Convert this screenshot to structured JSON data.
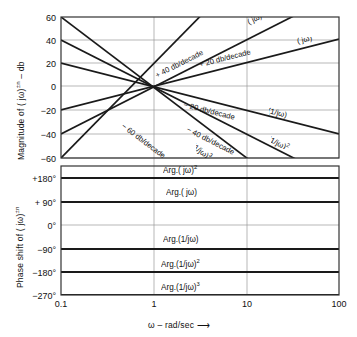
{
  "figure": {
    "x_axis": {
      "label": "ω – rad/sec ⟶",
      "ticks": [
        "0.1",
        "1",
        "10",
        "100"
      ],
      "tick_values": [
        0.1,
        1,
        10,
        100
      ],
      "scale": "log"
    },
    "magnitude_panel": {
      "axis_title_html": "Magnitude of ( jω)<sup>±n</sup> – db",
      "ticks": [
        "60",
        "40",
        "20",
        "0",
        "−20",
        "−40",
        "−60"
      ],
      "tick_values": [
        60,
        40,
        20,
        0,
        -20,
        -40,
        -60
      ]
    },
    "phase_panel": {
      "axis_title_html": "Phase shift of ( jω)<sup>±n</sup>",
      "ticks": [
        "+180°",
        "+ 90°",
        "0°",
        "−90°",
        "−180°",
        "−270°"
      ],
      "tick_values": [
        180,
        90,
        0,
        -90,
        -180,
        -270
      ]
    },
    "slope_annotations": [
      {
        "text": "+ 40 db/decade"
      },
      {
        "text": "+ 20 db/decade"
      },
      {
        "text": "− 20 db/decade"
      },
      {
        "text": "− 40 db/decade"
      },
      {
        "text": "− 60 db/decade"
      }
    ],
    "curve_labels": [
      {
        "text_html": "( jω)<sup>2</sup>"
      },
      {
        "text_html": "( jω)"
      },
      {
        "text_html": "(1/jω)"
      },
      {
        "text_html": "(1/jω)<sup>2</sup>"
      },
      {
        "text_html": "(1/jω)<sup>3</sup>"
      }
    ],
    "phase_line_labels": [
      {
        "text_html": "Arg.( jω)<sup>2</sup>"
      },
      {
        "text_html": "Arg.( jω)"
      },
      {
        "text_html": "Arg.(1/jω)"
      },
      {
        "text_html": "Arg.(1/jω)<sup>2</sup>"
      },
      {
        "text_html": "Arg.(1/jω)<sup>3</sup>"
      }
    ],
    "colors": {
      "line": "#1a1a1a",
      "grid": "#9a9a9a",
      "frame": "#333333",
      "background": "#ffffff"
    }
  },
  "chart_data": {
    "type": "line",
    "title": "",
    "xlabel": "ω – rad/sec",
    "xscale": "log",
    "xlim": [
      0.1,
      100
    ],
    "xticks": [
      0.1,
      1,
      10,
      100
    ],
    "panels": [
      {
        "name": "magnitude",
        "ylabel": "Magnitude of (jω)^±n – db",
        "ylim": [
          -60,
          60
        ],
        "yticks": [
          -60,
          -40,
          -20,
          0,
          20,
          40,
          60
        ],
        "grid": true,
        "series": [
          {
            "name": "(jω)^3",
            "slope_db_per_decade": 60,
            "x": [
              0.1,
              100
            ],
            "values": [
              -60,
              120
            ],
            "annotation": "",
            "clipped_to_ylim": true
          },
          {
            "name": "(jω)^2",
            "slope_db_per_decade": 40,
            "x": [
              0.1,
              100
            ],
            "values": [
              -40,
              80
            ],
            "annotation": "+ 40 db/decade",
            "clipped_to_ylim": true
          },
          {
            "name": "(jω)",
            "slope_db_per_decade": 20,
            "x": [
              0.1,
              100
            ],
            "values": [
              -20,
              40
            ],
            "annotation": "+ 20 db/decade",
            "clipped_to_ylim": true
          },
          {
            "name": "(1/jω)",
            "slope_db_per_decade": -20,
            "x": [
              0.1,
              100
            ],
            "values": [
              20,
              -40
            ],
            "annotation": "− 20 db/decade",
            "clipped_to_ylim": true
          },
          {
            "name": "(1/jω)^2",
            "slope_db_per_decade": -40,
            "x": [
              0.1,
              100
            ],
            "values": [
              40,
              -80
            ],
            "annotation": "− 40 db/decade",
            "clipped_to_ylim": true
          },
          {
            "name": "(1/jω)^3",
            "slope_db_per_decade": -60,
            "x": [
              0.1,
              100
            ],
            "values": [
              60,
              -120
            ],
            "annotation": "− 60 db/decade",
            "clipped_to_ylim": true
          }
        ],
        "note": "All magnitude asymptotes intersect at ω = 1 rad/sec, 0 db"
      },
      {
        "name": "phase",
        "ylabel": "Phase shift of (jω)^±n",
        "ylim": [
          -270,
          180
        ],
        "yticks": [
          -270,
          -180,
          -90,
          0,
          90,
          180
        ],
        "grid": true,
        "series": [
          {
            "name": "Arg.(jω)^2",
            "constant_deg": 180,
            "x": [
              0.1,
              100
            ],
            "values": [
              180,
              180
            ]
          },
          {
            "name": "Arg.(jω)",
            "constant_deg": 90,
            "x": [
              0.1,
              100
            ],
            "values": [
              90,
              90
            ]
          },
          {
            "name": "Arg.(1/jω)",
            "constant_deg": -90,
            "x": [
              0.1,
              100
            ],
            "values": [
              -90,
              -90
            ]
          },
          {
            "name": "Arg.(1/jω)^2",
            "constant_deg": -180,
            "x": [
              0.1,
              100
            ],
            "values": [
              -180,
              -180
            ]
          },
          {
            "name": "Arg.(1/jω)^3",
            "constant_deg": -270,
            "x": [
              0.1,
              100
            ],
            "values": [
              -270,
              -270
            ]
          }
        ]
      }
    ]
  }
}
